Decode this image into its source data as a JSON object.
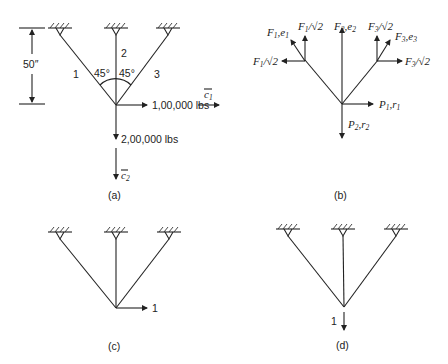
{
  "figure": {
    "panels": [
      {
        "id": "a",
        "caption": "(a)",
        "dimension_label": "50″",
        "member_labels": [
          "1",
          "2",
          "3"
        ],
        "angle_labels": [
          "45°",
          "45°"
        ],
        "horizontal_load": "1,00,000 lbs",
        "vertical_load": "2,00,000 lbs",
        "axis_c1": "c",
        "axis_c1_sub": "1",
        "axis_c2": "c",
        "axis_c2_sub": "2"
      },
      {
        "id": "b",
        "caption": "(b)",
        "forces": {
          "f1_e1": {
            "main": "F",
            "sub": "1",
            "sep": ",e",
            "sub2": "1"
          },
          "f1_root2_vert": {
            "main": "F",
            "sub": "1",
            "rest": "/√2"
          },
          "f1_root2_horiz": {
            "main": "F",
            "sub": "1",
            "rest": "/√2"
          },
          "f2_e2": {
            "main": "F",
            "sub": "2",
            "sep": ",e",
            "sub2": "2"
          },
          "f3_root2_vert": {
            "main": "F",
            "sub": "3",
            "rest": "/√2"
          },
          "f3_e3": {
            "main": "F",
            "sub": "3",
            "sep": ",e",
            "sub2": "3"
          },
          "f3_root2_horiz": {
            "main": "F",
            "sub": "3",
            "rest": "/√2"
          },
          "p1_r1": {
            "main": "P",
            "sub": "1",
            "sep": ",r",
            "sub2": "1"
          },
          "p2_r2": {
            "main": "P",
            "sub": "2",
            "sep": ",r",
            "sub2": "2"
          }
        }
      },
      {
        "id": "c",
        "caption": "(c)",
        "unit_load_label": "1",
        "unit_load_direction": "horizontal"
      },
      {
        "id": "d",
        "caption": "(d)",
        "unit_load_label": "1",
        "unit_load_direction": "vertical"
      }
    ]
  }
}
